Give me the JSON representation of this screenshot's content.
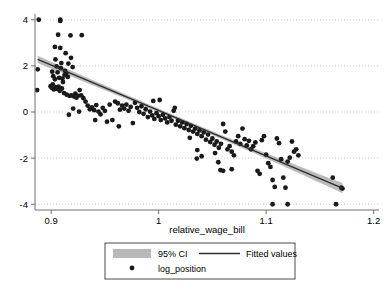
{
  "chart_data": {
    "type": "scatter",
    "title": "",
    "subtitle": "",
    "xlabel": "relative_wage_bill",
    "ylabel": "",
    "xlim": [
      0.885,
      1.205
    ],
    "ylim": [
      -4.25,
      4.25
    ],
    "xticks": [
      0.9,
      1,
      1.1,
      1.2
    ],
    "xtick_labels": [
      "0.9",
      "1",
      "1.1",
      "1.2"
    ],
    "yticks": [
      4,
      2,
      0,
      -2,
      -4
    ],
    "ytick_labels": [
      "4",
      "2",
      "0",
      "-2",
      "-4"
    ],
    "grid": "horizontal-dotted",
    "legend_position": "bottom-center",
    "legend": [
      {
        "key": "ci-band",
        "label": "95% CI",
        "marker": "band",
        "color": "#b0b0b0"
      },
      {
        "key": "fitted-line",
        "label": "Fitted values",
        "marker": "line",
        "color": "#2f2f2f"
      },
      {
        "key": "scatter-points",
        "label": "log_position",
        "marker": "dot",
        "color": "#1a1a1a"
      }
    ],
    "series": [
      {
        "name": "log_position",
        "type": "scatter",
        "marker": "circle",
        "color": "#1a1a1a",
        "points": [
          [
            0.8885,
            4.0
          ],
          [
            0.9085,
            4.0
          ],
          [
            0.9085,
            3.95
          ],
          [
            0.8875,
            1.85
          ],
          [
            0.887,
            0.95
          ],
          [
            0.9065,
            3.35
          ],
          [
            0.918,
            3.32
          ],
          [
            0.9285,
            3.33
          ],
          [
            0.9035,
            2.82
          ],
          [
            0.9085,
            2.78
          ],
          [
            0.9135,
            2.55
          ],
          [
            0.904,
            2.28
          ],
          [
            0.9095,
            2.12
          ],
          [
            0.9185,
            2.35
          ],
          [
            0.905,
            1.98
          ],
          [
            0.909,
            1.9
          ],
          [
            0.9125,
            1.6
          ],
          [
            0.901,
            1.75
          ],
          [
            0.902,
            1.55
          ],
          [
            0.9035,
            1.42
          ],
          [
            0.906,
            1.72
          ],
          [
            0.9075,
            1.48
          ],
          [
            0.9105,
            1.45
          ],
          [
            0.911,
            1.3
          ],
          [
            0.913,
            1.78
          ],
          [
            0.914,
            1.68
          ],
          [
            0.9155,
            1.52
          ],
          [
            0.916,
            2.1
          ],
          [
            0.92,
            1.95
          ],
          [
            0.8995,
            1.12
          ],
          [
            0.9005,
            1.05
          ],
          [
            0.9015,
            1.2
          ],
          [
            0.9025,
            0.98
          ],
          [
            0.9045,
            1.08
          ],
          [
            0.9055,
            1.0
          ],
          [
            0.907,
            1.1
          ],
          [
            0.908,
            0.92
          ],
          [
            0.91,
            1.02
          ],
          [
            0.912,
            0.82
          ],
          [
            0.9145,
            0.75
          ],
          [
            0.917,
            0.7
          ],
          [
            0.919,
            0.72
          ],
          [
            0.921,
            0.68
          ],
          [
            0.9225,
            0.8
          ],
          [
            0.9235,
            0.62
          ],
          [
            0.925,
            0.7
          ],
          [
            0.9265,
            0.95
          ],
          [
            0.928,
            0.72
          ],
          [
            0.93,
            0.6
          ],
          [
            0.932,
            0.45
          ],
          [
            0.9205,
            0.15
          ],
          [
            0.9165,
            -0.12
          ],
          [
            0.926,
            0.02
          ],
          [
            0.934,
            0.28
          ],
          [
            0.936,
            0.12
          ],
          [
            0.938,
            0.2
          ],
          [
            0.94,
            0.08
          ],
          [
            0.942,
            0.3
          ],
          [
            0.944,
            0.02
          ],
          [
            0.946,
            -0.1
          ],
          [
            0.948,
            0.18
          ],
          [
            0.95,
            0.05
          ],
          [
            0.941,
            -0.35
          ],
          [
            0.952,
            -0.42
          ],
          [
            0.957,
            -0.35
          ],
          [
            0.9545,
            0.32
          ],
          [
            0.9595,
            0.45
          ],
          [
            0.962,
            0.38
          ],
          [
            0.964,
            0.1
          ],
          [
            0.966,
            0.28
          ],
          [
            0.968,
            0.15
          ],
          [
            0.97,
            0.32
          ],
          [
            0.972,
            0.05
          ],
          [
            0.974,
            0.22
          ],
          [
            0.963,
            -0.62
          ],
          [
            0.976,
            -0.48
          ],
          [
            0.978,
            0.4
          ],
          [
            0.98,
            0.18
          ],
          [
            0.982,
            0.0
          ],
          [
            0.984,
            0.25
          ],
          [
            0.986,
            -0.08
          ],
          [
            0.988,
            0.12
          ],
          [
            0.99,
            -0.22
          ],
          [
            0.992,
            0.02
          ],
          [
            0.994,
            -0.15
          ],
          [
            0.996,
            -0.3
          ],
          [
            0.998,
            -0.05
          ],
          [
            1.0,
            -0.18
          ],
          [
            1.002,
            -0.35
          ],
          [
            1.004,
            -0.12
          ],
          [
            1.006,
            -0.28
          ],
          [
            1.008,
            -0.45
          ],
          [
            1.01,
            -0.22
          ],
          [
            1.012,
            -0.38
          ],
          [
            0.995,
            0.48
          ],
          [
            1.001,
            0.52
          ],
          [
            1.014,
            0.05
          ],
          [
            1.016,
            -0.55
          ],
          [
            1.018,
            -0.38
          ],
          [
            1.02,
            -0.62
          ],
          [
            1.022,
            -0.45
          ],
          [
            1.024,
            -0.7
          ],
          [
            1.026,
            -0.52
          ],
          [
            1.028,
            -0.78
          ],
          [
            1.03,
            -0.6
          ],
          [
            1.032,
            -0.85
          ],
          [
            1.015,
            0.18
          ],
          [
            1.034,
            -0.72
          ],
          [
            1.036,
            -0.95
          ],
          [
            1.038,
            -0.8
          ],
          [
            1.04,
            -1.05
          ],
          [
            1.042,
            -0.88
          ],
          [
            1.029,
            -1.12
          ],
          [
            1.044,
            -1.2
          ],
          [
            1.046,
            -0.98
          ],
          [
            1.036,
            -1.65
          ],
          [
            1.04,
            -1.92
          ],
          [
            1.0355,
            -2.02
          ],
          [
            1.048,
            -1.3
          ],
          [
            1.05,
            -1.15
          ],
          [
            1.052,
            -1.42
          ],
          [
            1.054,
            -1.28
          ],
          [
            1.056,
            -1.55
          ],
          [
            1.058,
            -1.38
          ],
          [
            1.0525,
            -1.78
          ],
          [
            1.0555,
            -2.18
          ],
          [
            1.0575,
            -2.52
          ],
          [
            1.06,
            -0.52
          ],
          [
            1.062,
            -0.85
          ],
          [
            1.064,
            -1.62
          ],
          [
            1.066,
            -1.48
          ],
          [
            1.068,
            -1.72
          ],
          [
            1.07,
            -1.88
          ],
          [
            1.072,
            -1.28
          ],
          [
            1.074,
            -1.05
          ],
          [
            1.076,
            -1.38
          ],
          [
            1.06,
            -2.55
          ],
          [
            1.068,
            -2.48
          ],
          [
            1.078,
            -0.72
          ],
          [
            1.08,
            -1.18
          ],
          [
            1.082,
            -1.45
          ],
          [
            1.084,
            -1.25
          ],
          [
            1.086,
            -1.62
          ],
          [
            1.088,
            -1.48
          ],
          [
            1.09,
            -1.32
          ],
          [
            1.092,
            -2.55
          ],
          [
            1.094,
            -2.68
          ],
          [
            1.096,
            -1.22
          ],
          [
            1.098,
            -1.05
          ],
          [
            1.1,
            -1.85
          ],
          [
            1.102,
            -2.22
          ],
          [
            1.104,
            -2.38
          ],
          [
            1.106,
            -2.95
          ],
          [
            1.108,
            -3.25
          ],
          [
            1.106,
            -4.0
          ],
          [
            1.11,
            -1.15
          ],
          [
            1.112,
            -1.35
          ],
          [
            1.114,
            -2.05
          ],
          [
            1.116,
            -2.85
          ],
          [
            1.118,
            -3.28
          ],
          [
            1.12,
            -2.15
          ],
          [
            1.122,
            -1.98
          ],
          [
            1.124,
            -1.28
          ],
          [
            1.126,
            -1.72
          ],
          [
            1.12,
            -4.0
          ],
          [
            1.128,
            -1.62
          ],
          [
            1.13,
            -1.88
          ],
          [
            1.162,
            -2.85
          ],
          [
            1.165,
            -4.0
          ],
          [
            1.17,
            -3.28
          ],
          [
            1.171,
            -3.32
          ]
        ]
      },
      {
        "name": "Fitted values",
        "type": "line",
        "color": "#2f2f2f",
        "x_start": 0.8875,
        "x_end": 1.171,
        "y_start": 2.28,
        "y_end": -3.3
      },
      {
        "name": "95% CI",
        "type": "band",
        "color": "#b0b0b0",
        "half_width_start": 0.16,
        "half_width_mid": 0.08,
        "half_width_end": 0.22
      }
    ]
  }
}
